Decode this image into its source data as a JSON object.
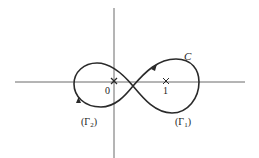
{
  "diagram": {
    "type": "contour-figure-eight",
    "colors": {
      "stroke": "#2a2a2a",
      "text": "#222222",
      "background": "#ffffff"
    },
    "axes": {
      "horizontal": {
        "x1": 15,
        "x2": 245,
        "y": 82
      },
      "vertical": {
        "x": 114,
        "y1": 8,
        "y2": 158
      }
    },
    "points": [
      {
        "name": "origin",
        "label": "0",
        "x": 114,
        "y": 81
      },
      {
        "name": "one",
        "label": "1",
        "x": 166,
        "y": 81
      }
    ],
    "curve": {
      "label": "C",
      "crossing": {
        "x": 133,
        "y": 86
      }
    },
    "labels": {
      "curve": "C",
      "origin": "0",
      "one": "1",
      "gamma1": "(Γ",
      "gamma1_sub": "1",
      "gamma1_close": ")",
      "gamma2": "(Γ",
      "gamma2_sub": "2",
      "gamma2_close": ")"
    }
  }
}
